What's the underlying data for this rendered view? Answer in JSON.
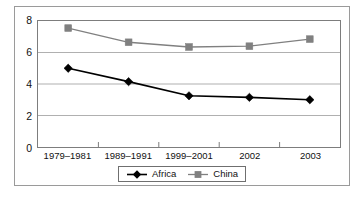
{
  "chart_data": {
    "type": "line",
    "title": "",
    "subtitle": "",
    "xlabel": "",
    "ylabel": "",
    "categories": [
      "1979–1981",
      "1989–1991",
      "1999–2001",
      "2002",
      "2003"
    ],
    "series": [
      {
        "name": "Africa",
        "color": "#000000",
        "marker": "diamond",
        "values": [
          5.0,
          4.15,
          3.25,
          3.15,
          3.0
        ]
      },
      {
        "name": "China",
        "color": "#808080",
        "marker": "square",
        "values": [
          7.55,
          6.65,
          6.35,
          6.4,
          6.85
        ]
      }
    ],
    "ylim": [
      0,
      8
    ],
    "yticks": [
      0,
      2,
      4,
      6,
      8
    ],
    "ytick_labels": [
      "0",
      "2",
      "4",
      "6",
      "8"
    ],
    "grid": true,
    "grid_axis": "y",
    "grid_color": "#b0b0b0",
    "legend_position": "bottom-center",
    "axis_color": "#7d7d7d",
    "background_color": "#ffffff"
  },
  "legend": {
    "entries": [
      {
        "label": "Africa",
        "icon": "diamond-marker-icon"
      },
      {
        "label": "China",
        "icon": "square-marker-icon"
      }
    ]
  }
}
